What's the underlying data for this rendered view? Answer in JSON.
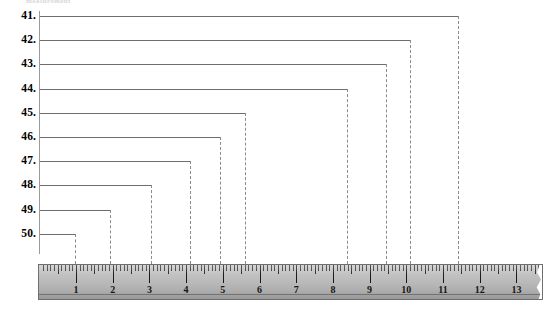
{
  "title_fragment": "measurement",
  "colors": {
    "line": "#6e6e6e",
    "dash": "#8b8b8b",
    "axis": "#9a9a9a",
    "ruler_face": "#bdbdbd",
    "ruler_edge": "#6f6f6f",
    "tick": "#171717",
    "text": "#000000"
  },
  "chart_data": {
    "type": "bar",
    "title": "measurement",
    "xlabel": "",
    "ylabel": "",
    "orientation": "horizontal",
    "grid": false,
    "legend": null,
    "x_axis": {
      "name": "ruler",
      "unit": "inches",
      "min": 0,
      "max": 13.7,
      "tick_labels": [
        "1",
        "2",
        "3",
        "4",
        "5",
        "6",
        "7",
        "8",
        "9",
        "10",
        "11",
        "12",
        "13"
      ],
      "major_tick_interval": 1,
      "minor_ticks_per_major": 10
    },
    "categories": [
      "41.",
      "42.",
      "43.",
      "44.",
      "45.",
      "46.",
      "47.",
      "48.",
      "49.",
      "50."
    ],
    "values": [
      11.4,
      10.1,
      9.45,
      8.4,
      5.6,
      4.95,
      4.1,
      3.05,
      1.95,
      1.0
    ],
    "ylim": [
      0,
      13.7
    ],
    "rows": [
      {
        "label": "41.",
        "value": 11.4,
        "end_px": 458
      },
      {
        "label": "42.",
        "value": 10.1,
        "end_px": 410
      },
      {
        "label": "43.",
        "value": 9.45,
        "end_px": 386
      },
      {
        "label": "44.",
        "value": 8.4,
        "end_px": 347
      },
      {
        "label": "45.",
        "value": 5.6,
        "end_px": 245
      },
      {
        "label": "46.",
        "value": 4.95,
        "end_px": 220
      },
      {
        "label": "47.",
        "value": 4.1,
        "end_px": 190
      },
      {
        "label": "48.",
        "value": 3.05,
        "end_px": 151
      },
      {
        "label": "49.",
        "value": 1.95,
        "end_px": 110
      },
      {
        "label": "50.",
        "value": 1.0,
        "end_px": 75
      }
    ]
  }
}
